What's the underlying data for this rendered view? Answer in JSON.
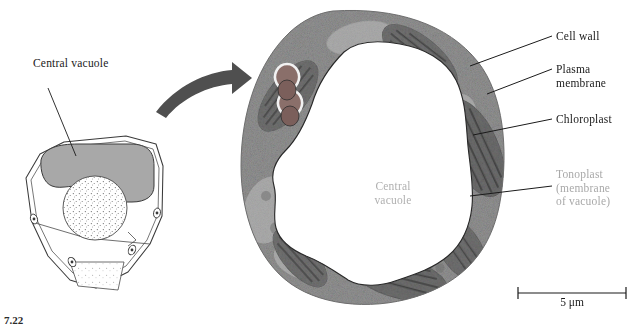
{
  "figure": {
    "number": "7.22",
    "schematic": {
      "label": "Central vacuole",
      "vacuole_fill": "#a8a8a8",
      "outline_color": "#3a3a3a"
    },
    "arrow": {
      "name": "curved-arrow",
      "color": "#4a4a4a"
    },
    "micrograph": {
      "inner_label": "Central\nvacuole",
      "inner_label_color": "#b0b0b0",
      "cytoplasm_color": "#a0a0a0",
      "chloroplast_color": "#6e6e6e",
      "vacuole_color": "#ffffff",
      "wall_color": "#c8c8c8"
    },
    "callouts": [
      {
        "id": "cell-wall",
        "text": "Cell wall",
        "color": "#1a1a1a"
      },
      {
        "id": "plasma-membrane",
        "text": "Plasma\nmembrane",
        "color": "#1a1a1a"
      },
      {
        "id": "chloroplast",
        "text": "Chloroplast",
        "color": "#1a1a1a"
      },
      {
        "id": "tonoplast",
        "text": "Tonoplast\n(membrane\nof vacuole)",
        "color": "#a9a9a9"
      }
    ],
    "scale_bar": {
      "text": "5 μm",
      "length_px": 108
    }
  }
}
